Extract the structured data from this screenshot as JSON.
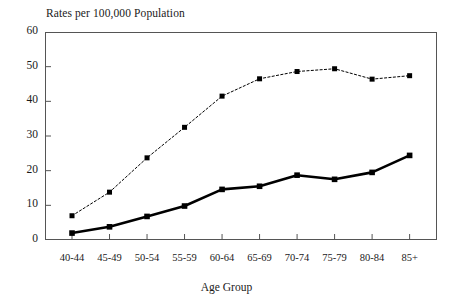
{
  "chart_data": {
    "type": "line",
    "title": "Rates per 100,000 Population",
    "xlabel": "Age Group",
    "ylabel": "",
    "ylim": [
      0,
      60
    ],
    "yticks": [
      0,
      10,
      20,
      30,
      40,
      50,
      60
    ],
    "grid": false,
    "legend": "none",
    "categories": [
      "40-44",
      "45-49",
      "50-54",
      "55-59",
      "60-64",
      "65-69",
      "70-74",
      "75-79",
      "80-84",
      "85+"
    ],
    "series": [
      {
        "name": "upper-dotted-series",
        "style": "dotted",
        "color": "#000000",
        "marker": "square",
        "values": [
          7.0,
          13.8,
          23.7,
          32.5,
          41.5,
          46.5,
          48.6,
          49.4,
          46.4,
          47.4
        ]
      },
      {
        "name": "lower-solid-series",
        "style": "solid",
        "color": "#000000",
        "marker": "square",
        "values": [
          2.0,
          3.8,
          6.8,
          9.8,
          14.6,
          15.5,
          18.7,
          17.5,
          19.5,
          24.4
        ]
      }
    ]
  },
  "axis": {
    "y_labels": [
      "60",
      "50",
      "40",
      "30",
      "20",
      "10",
      "0"
    ],
    "x_labels": [
      "40-44",
      "45-49",
      "50-54",
      "55-59",
      "60-64",
      "65-69",
      "70-74",
      "75-79",
      "80-84",
      "85+"
    ],
    "x_title": "Age Group"
  },
  "colors": {
    "frame": "#555555",
    "ink": "#1a1a1a",
    "series": "#000000"
  }
}
